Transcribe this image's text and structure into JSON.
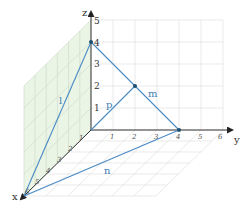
{
  "diagram": {
    "type": "3d-coordinate-lines",
    "axes": {
      "x": {
        "label": "x",
        "ticks": [
          "1",
          "2",
          "3",
          "4",
          "5",
          "6"
        ]
      },
      "y": {
        "label": "y",
        "ticks": [
          "1",
          "2",
          "3",
          "4",
          "5",
          "6"
        ]
      },
      "z": {
        "label": "z",
        "ticks": [
          "1",
          "2",
          "3",
          "4",
          "5"
        ]
      }
    },
    "lines": [
      {
        "name": "l",
        "label": "l",
        "from": [
          6,
          0,
          0
        ],
        "to": [
          0,
          0,
          4
        ]
      },
      {
        "name": "m",
        "label": "m",
        "from": [
          0,
          0,
          4
        ],
        "to": [
          0,
          4,
          0
        ]
      },
      {
        "name": "n",
        "label": "n",
        "from": [
          6,
          0,
          0
        ],
        "to": [
          0,
          4,
          0
        ]
      },
      {
        "name": "p",
        "label": "p",
        "from": [
          0,
          0,
          0
        ],
        "to": [
          0,
          2,
          2
        ]
      }
    ],
    "points": [
      {
        "label": "z-intercept",
        "coords": [
          0,
          0,
          4
        ]
      },
      {
        "label": "y-intercept",
        "coords": [
          0,
          4,
          0
        ]
      },
      {
        "label": "midpoint",
        "coords": [
          0,
          2,
          2
        ]
      }
    ],
    "colors": {
      "line": "#4a8ac4",
      "axis": "#333333",
      "grid": "#d4d8d4",
      "xz_plane": "#e6f3e2",
      "point": "#1f4f6f"
    }
  }
}
